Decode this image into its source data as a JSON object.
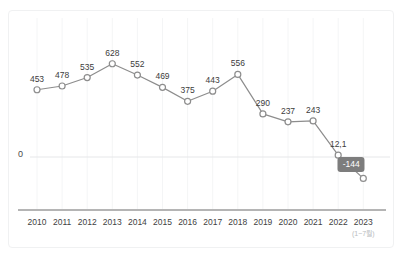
{
  "corner_note": "",
  "axis": {
    "zero_label": "0",
    "period_note": "(1~7월)"
  },
  "colors": {
    "line": "#8d8d8d",
    "marker_stroke": "#8d8d8d",
    "marker_fill": "#ffffff",
    "badge_bg": "#7d7d7d",
    "badge_text": "#ffffff",
    "grid": "#f4f5f6",
    "zero_line": "#e6e7e9",
    "axis_line": "#6b6b6b",
    "frame_border": "#f0f1f2",
    "label_text": "#3c3c3c"
  },
  "chart_data": {
    "type": "line",
    "title": "",
    "subtitle": "",
    "xlabel": "",
    "ylabel": "",
    "grid": true,
    "legend": false,
    "categories": [
      "2010",
      "2011",
      "2012",
      "2013",
      "2014",
      "2015",
      "2016",
      "2017",
      "2018",
      "2019",
      "2020",
      "2021",
      "2022",
      "2023"
    ],
    "category_notes": [
      "",
      "",
      "",
      "",
      "",
      "",
      "",
      "",
      "",
      "",
      "",
      "",
      "",
      "(1~7월)"
    ],
    "values": [
      453,
      478,
      535,
      628,
      552,
      469,
      375,
      443,
      556,
      290,
      237,
      243,
      12.1,
      -144
    ],
    "point_labels": [
      "453",
      "478",
      "535",
      "628",
      "552",
      "469",
      "375",
      "443",
      "556",
      "290",
      "237",
      "243",
      "12,1",
      "-144"
    ],
    "highlight_index": 13,
    "ylim": [
      -200,
      700
    ],
    "yticks": [
      0
    ],
    "ytick_labels": [
      "0"
    ]
  }
}
